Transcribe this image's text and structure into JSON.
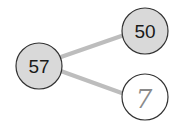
{
  "diagram": {
    "type": "number-bond",
    "whole": {
      "value": "57",
      "filled": true
    },
    "parts": [
      {
        "value": "50",
        "filled": true
      },
      {
        "value": "7",
        "filled": false,
        "handwritten": true
      }
    ],
    "colors": {
      "filled_circle": "#d9d9d9",
      "empty_circle": "#ffffff",
      "circle_stroke": "#333333",
      "connector": "#bdbdbd",
      "handwritten_text": "#8a8a8a"
    }
  }
}
